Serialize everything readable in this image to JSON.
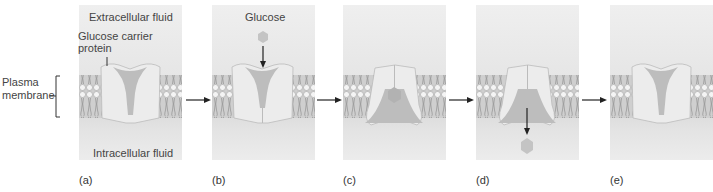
{
  "figure": {
    "left_label": "Plasma\nmembrane",
    "left_label_line1": "Plasma",
    "left_label_line2": "membrane",
    "panels": [
      {
        "id": "a",
        "label": "(a)",
        "top_text": "Extracellular fluid",
        "callout": "Glucose carrier\nprotein",
        "callout_line1": "Glucose carrier",
        "callout_line2": "protein",
        "bottom_text": "Intracellular fluid",
        "state": "open to outside"
      },
      {
        "id": "b",
        "label": "(b)",
        "top_text": "Glucose",
        "state": "glucose binds"
      },
      {
        "id": "c",
        "label": "(c)",
        "state": "conformational change"
      },
      {
        "id": "d",
        "label": "(d)",
        "state": "glucose released inside"
      },
      {
        "id": "e",
        "label": "(e)",
        "state": "returns to original shape"
      }
    ],
    "colors": {
      "background": "#ffffff",
      "panel": "#e8e8e8",
      "membrane": "#b7b7b7",
      "protein": "#e9e9e9",
      "channel": "#bdbdbd",
      "glucose": "#c4c4c4",
      "arrow": "#222222"
    }
  }
}
